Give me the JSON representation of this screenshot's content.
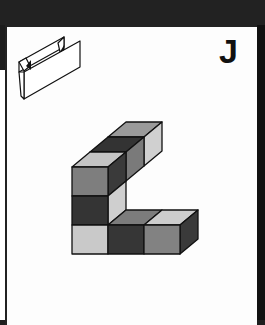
{
  "card": {
    "label": "J",
    "icon": "folded-paper-strip-icon",
    "figure": "isometric-cube-structure"
  },
  "colors": {
    "background": "#1e1e1e",
    "card": "#fdfdfd",
    "outline": "#111111",
    "cube_light": "#c8c8c8",
    "cube_mid": "#808080",
    "cube_dark": "#3a3a3a"
  }
}
